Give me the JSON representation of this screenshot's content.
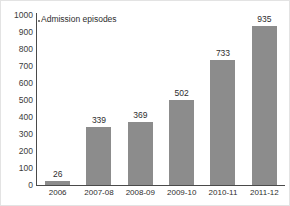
{
  "chart_data": {
    "type": "bar",
    "title": "Admission episodes",
    "xlabel": "",
    "ylabel": "",
    "categories": [
      "2006",
      "2007-08",
      "2008-09",
      "2009-10",
      "2010-11",
      "2011-12"
    ],
    "values": [
      26,
      339,
      369,
      502,
      733,
      935
    ],
    "value_labels": [
      "26",
      "339",
      "369",
      "502",
      "733",
      "935"
    ],
    "ylim": [
      0,
      1000
    ],
    "ytick_labels": [
      "1000",
      "900",
      "800",
      "700",
      "600",
      "500",
      "400",
      "300",
      "200",
      "100",
      "0"
    ],
    "ytick_values": [
      1000,
      900,
      800,
      700,
      600,
      500,
      400,
      300,
      200,
      100,
      0
    ],
    "grid": false,
    "legend_position": "top-left-inline",
    "series": [
      {
        "name": "Admission episodes",
        "values": [
          26,
          339,
          369,
          502,
          733,
          935
        ],
        "color": "#8c8c8c"
      }
    ],
    "colors": {
      "bar_fill": "#8c8c8c",
      "axis": "#4a4a4a",
      "text": "#2e2e2e",
      "tick_text": "#3b3b3b",
      "background": "#ffffff",
      "frame": "#e3e3e3"
    }
  }
}
